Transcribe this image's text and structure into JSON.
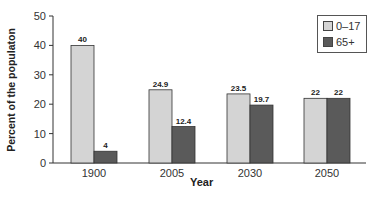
{
  "chart_data": {
    "type": "bar",
    "title": "",
    "xlabel": "Year",
    "ylabel": "Percent of the populaton",
    "categories": [
      "1900",
      "2005",
      "2030",
      "2050"
    ],
    "series": [
      {
        "name": "0–17",
        "values": [
          40,
          24.9,
          23.5,
          22
        ],
        "color": "#d4d4d4"
      },
      {
        "name": "65+",
        "values": [
          4,
          12.4,
          19.7,
          22
        ],
        "color": "#5a5a5a"
      }
    ],
    "data_labels": [
      [
        "40",
        "24.9",
        "23.5",
        "22"
      ],
      [
        "4",
        "12.4",
        "19.7",
        "22"
      ]
    ],
    "ylim": [
      0,
      50
    ],
    "yticks": [
      0,
      10,
      20,
      30,
      40,
      50
    ],
    "grid": false,
    "legend_position": "upper right"
  },
  "legend": {
    "items": [
      {
        "label": "0–17",
        "color": "#d4d4d4"
      },
      {
        "label": "65+",
        "color": "#5a5a5a"
      }
    ]
  }
}
